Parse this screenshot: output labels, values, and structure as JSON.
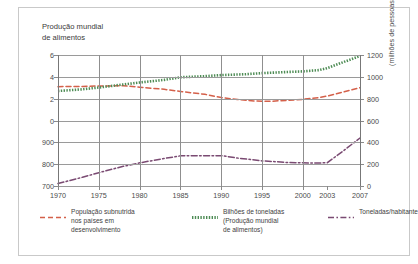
{
  "credit": "Allmaps/Arquivo da editora",
  "chart_data": {
    "type": "line",
    "title": "Produção mundial\nde alimentos",
    "xlabel": "",
    "ylabel": "",
    "grid": true,
    "legend_position": "bottom",
    "x": [
      1970,
      1975,
      1980,
      1985,
      1990,
      1995,
      2000,
      2003,
      2007
    ],
    "xtick_labels": [
      "1970",
      "1975",
      "1980",
      "1985",
      "1990",
      "1995",
      "2000",
      "2003",
      "2007"
    ],
    "axes": {
      "left": {
        "tick_labels": [
          "6",
          "4",
          "2",
          "0",
          "900",
          "800",
          "700"
        ],
        "title": "",
        "note": "upper half is Bilhões de toneladas (0-6); lower half is Toneladas/habitante (700-900)"
      },
      "right": {
        "tick_labels": [
          "1200",
          "1000",
          "800",
          "600",
          "400",
          "200",
          "0"
        ],
        "title": "(milhões de pessoas)",
        "range": [
          0,
          1200
        ]
      }
    },
    "series": [
      {
        "name": "População subnutrida\nnos países em\ndesenvolvimento",
        "legend_label": "População subnutrida\nnos países em\ndesenvolvimento",
        "color": "#d4604a",
        "style": "dashed",
        "axis": "left-upper",
        "unit": "bilhões de pessoas (escala 0-6)",
        "x": [
          1970,
          1973,
          1975,
          1978,
          1980,
          1983,
          1985,
          1988,
          1990,
          1992,
          1994,
          1996,
          1998,
          2000,
          2002,
          2003,
          2005,
          2007
        ],
        "values": [
          3.1,
          3.12,
          3.16,
          3.18,
          3.05,
          2.86,
          2.66,
          2.4,
          2.1,
          1.92,
          1.78,
          1.76,
          1.84,
          1.94,
          2.1,
          2.24,
          2.62,
          3.0
        ]
      },
      {
        "name": "Bilhões de toneladas\n(Produção mundial\nde alimentos)",
        "legend_label": "Bilhões de toneladas\n(Produção mundial\nde alimentos)",
        "color": "#4e8c55",
        "style": "dotted",
        "axis": "left-upper",
        "unit": "bilhões de toneladas",
        "x": [
          1970,
          1973,
          1975,
          1978,
          1980,
          1983,
          1985,
          1988,
          1990,
          1993,
          1995,
          1998,
          2000,
          2002,
          2003,
          2005,
          2007
        ],
        "values": [
          2.7,
          2.86,
          3.02,
          3.3,
          3.48,
          3.72,
          3.96,
          4.06,
          4.16,
          4.24,
          4.34,
          4.44,
          4.5,
          4.62,
          4.8,
          5.36,
          5.9
        ]
      },
      {
        "name": "Toneladas/habitante",
        "legend_label": "Toneladas/habitante",
        "color": "#7a4a72",
        "style": "dash-dot",
        "axis": "left-lower",
        "unit": "toneladas por habitante (escala 700-900)",
        "x": [
          1970,
          1973,
          1975,
          1978,
          1980,
          1983,
          1985,
          1988,
          1990,
          1992,
          1995,
          1998,
          2000,
          2002,
          2003,
          2005,
          2007
        ],
        "values": [
          711,
          740,
          761,
          790,
          806,
          826,
          838,
          839,
          839,
          828,
          815,
          808,
          806,
          805,
          807,
          862,
          920
        ]
      }
    ]
  }
}
